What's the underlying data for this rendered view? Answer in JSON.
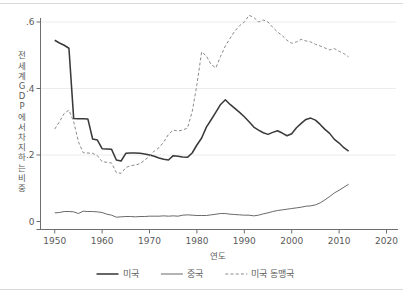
{
  "chart_data": {
    "type": "line",
    "title": "",
    "subtitle": "",
    "xlabel": "연도",
    "ylabel": "전 세계 GDP에서 차지하는 비중",
    "ylabel_chars": [
      "전",
      "세",
      "계",
      "G",
      "D",
      "P",
      "에",
      "서",
      "차",
      "지",
      "하",
      "는",
      "비",
      "중"
    ],
    "xlim": [
      1947,
      2022
    ],
    "ylim": [
      -0.02,
      0.645
    ],
    "xticks": [
      1950,
      1960,
      1970,
      1980,
      1990,
      2000,
      2010,
      2020
    ],
    "xticklabels": [
      "1950",
      "1960",
      "1970",
      "1980",
      "1990",
      "2000",
      "2010",
      "2020"
    ],
    "yticks": [
      0,
      0.2,
      0.4,
      0.6
    ],
    "yticklabels": [
      "0",
      ".2",
      ".4",
      ".6"
    ],
    "grid": "horizontal",
    "legend_position": "bottom",
    "series": [
      {
        "name": "미국",
        "style": "solid-thick",
        "color": "#3a3a3a",
        "x": [
          1950,
          1951,
          1952,
          1953,
          1954,
          1955,
          1956,
          1957,
          1958,
          1959,
          1960,
          1961,
          1962,
          1963,
          1964,
          1965,
          1966,
          1967,
          1968,
          1969,
          1970,
          1971,
          1972,
          1973,
          1974,
          1975,
          1976,
          1977,
          1978,
          1979,
          1980,
          1981,
          1982,
          1983,
          1984,
          1985,
          1986,
          1987,
          1988,
          1989,
          1990,
          1991,
          1992,
          1993,
          1994,
          1995,
          1996,
          1997,
          1998,
          1999,
          2000,
          2001,
          2002,
          2003,
          2004,
          2005,
          2006,
          2007,
          2008,
          2009,
          2010,
          2011,
          2012
        ],
        "values": [
          0.545,
          0.537,
          0.53,
          0.521,
          0.31,
          0.309,
          0.309,
          0.308,
          0.248,
          0.245,
          0.219,
          0.218,
          0.217,
          0.185,
          0.182,
          0.205,
          0.206,
          0.206,
          0.205,
          0.203,
          0.2,
          0.196,
          0.191,
          0.187,
          0.185,
          0.198,
          0.196,
          0.194,
          0.193,
          0.206,
          0.23,
          0.251,
          0.284,
          0.306,
          0.329,
          0.352,
          0.366,
          0.352,
          0.34,
          0.328,
          0.315,
          0.3,
          0.284,
          0.275,
          0.267,
          0.262,
          0.268,
          0.273,
          0.266,
          0.258,
          0.264,
          0.282,
          0.295,
          0.307,
          0.311,
          0.305,
          0.292,
          0.277,
          0.265,
          0.247,
          0.236,
          0.222,
          0.212
        ]
      },
      {
        "name": "중국",
        "style": "solid-thin",
        "color": "#585858",
        "x": [
          1950,
          1951,
          1952,
          1953,
          1954,
          1955,
          1956,
          1957,
          1958,
          1959,
          1960,
          1961,
          1962,
          1963,
          1964,
          1965,
          1966,
          1967,
          1968,
          1969,
          1970,
          1971,
          1972,
          1973,
          1974,
          1975,
          1976,
          1977,
          1978,
          1979,
          1980,
          1981,
          1982,
          1983,
          1984,
          1985,
          1986,
          1987,
          1988,
          1989,
          1990,
          1991,
          1992,
          1993,
          1994,
          1995,
          1996,
          1997,
          1998,
          1999,
          2000,
          2001,
          2002,
          2003,
          2004,
          2005,
          2006,
          2007,
          2008,
          2009,
          2010,
          2011,
          2012
        ],
        "values": [
          0.026,
          0.027,
          0.03,
          0.03,
          0.029,
          0.024,
          0.031,
          0.03,
          0.03,
          0.029,
          0.027,
          0.022,
          0.019,
          0.013,
          0.014,
          0.015,
          0.015,
          0.014,
          0.015,
          0.015,
          0.016,
          0.016,
          0.016,
          0.017,
          0.016,
          0.017,
          0.016,
          0.019,
          0.02,
          0.019,
          0.018,
          0.018,
          0.018,
          0.02,
          0.022,
          0.024,
          0.024,
          0.022,
          0.021,
          0.02,
          0.019,
          0.019,
          0.017,
          0.019,
          0.023,
          0.026,
          0.03,
          0.033,
          0.035,
          0.037,
          0.039,
          0.041,
          0.043,
          0.046,
          0.047,
          0.05,
          0.056,
          0.065,
          0.075,
          0.086,
          0.094,
          0.103,
          0.112
        ]
      },
      {
        "name": "미국 동맹국",
        "style": "dashed",
        "color": "#8a8a8a",
        "x": [
          1950,
          1951,
          1952,
          1953,
          1954,
          1955,
          1956,
          1957,
          1958,
          1959,
          1960,
          1961,
          1962,
          1963,
          1964,
          1965,
          1966,
          1967,
          1968,
          1969,
          1970,
          1971,
          1972,
          1973,
          1974,
          1975,
          1976,
          1977,
          1978,
          1979,
          1980,
          1981,
          1982,
          1983,
          1984,
          1985,
          1986,
          1987,
          1988,
          1989,
          1990,
          1991,
          1992,
          1993,
          1994,
          1995,
          1996,
          1997,
          1998,
          1999,
          2000,
          2001,
          2002,
          2003,
          2004,
          2005,
          2006,
          2007,
          2008,
          2009,
          2010,
          2011,
          2012
        ],
        "values": [
          0.278,
          0.3,
          0.325,
          0.335,
          0.3,
          0.24,
          0.207,
          0.206,
          0.205,
          0.198,
          0.18,
          0.178,
          0.176,
          0.147,
          0.145,
          0.162,
          0.168,
          0.17,
          0.174,
          0.185,
          0.196,
          0.212,
          0.222,
          0.239,
          0.262,
          0.275,
          0.272,
          0.275,
          0.281,
          0.33,
          0.412,
          0.51,
          0.498,
          0.472,
          0.462,
          0.497,
          0.528,
          0.551,
          0.573,
          0.589,
          0.6,
          0.62,
          0.614,
          0.6,
          0.606,
          0.6,
          0.584,
          0.57,
          0.559,
          0.545,
          0.536,
          0.54,
          0.548,
          0.543,
          0.54,
          0.533,
          0.528,
          0.522,
          0.516,
          0.52,
          0.512,
          0.505,
          0.495
        ]
      }
    ]
  },
  "legend": {
    "items": [
      {
        "label": "미국",
        "style": "solid-thick"
      },
      {
        "label": "중국",
        "style": "solid-thin"
      },
      {
        "label": "미국 동맹국",
        "style": "dashed"
      }
    ]
  },
  "colors": {
    "us": "#3a3a3a",
    "china": "#585858",
    "allies": "#8a8a8a",
    "axis": "#6e6e6e",
    "grid": "#ececec",
    "frame": "#d8d8d8",
    "background": "#ffffff"
  }
}
